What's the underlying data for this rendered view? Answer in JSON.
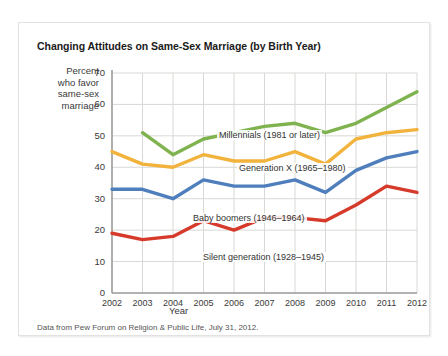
{
  "chart_data": {
    "type": "line",
    "title": "Changing Attitudes on Same-Sex Marriage (by Birth Year)",
    "xlabel": "Year",
    "ylabel": "Percent who favor same-sex marriage",
    "ylabel_lines": [
      "Percent",
      "who favor",
      "same-sex",
      "marriage"
    ],
    "source": "Data from Pew Forum on Religion & Public Life, July 31, 2012.",
    "x": [
      2002,
      2003,
      2004,
      2005,
      2006,
      2007,
      2008,
      2009,
      2010,
      2011,
      2012
    ],
    "xtick_labels": [
      "2002",
      "2003",
      "2004",
      "2005",
      "2006",
      "2007",
      "2008",
      "2009",
      "2010",
      "2011",
      "2012"
    ],
    "ytick_labels": [
      "0",
      "10",
      "20",
      "30",
      "40",
      "50",
      "60",
      "70"
    ],
    "ytick_values": [
      0,
      10,
      20,
      30,
      40,
      50,
      60,
      70
    ],
    "ylim": [
      0,
      70
    ],
    "xlim": [
      2002,
      2012
    ],
    "grid": true,
    "legend_position": "inline-annotations",
    "series": [
      {
        "name": "Millennials (1981 or later)",
        "label": "Millennials (1981 or later)",
        "color": "#7FB350",
        "x": [
          2003,
          2004,
          2005,
          2006,
          2007,
          2008,
          2009,
          2010,
          2011,
          2012
        ],
        "values": [
          51,
          44,
          49,
          51,
          53,
          54,
          51,
          54,
          59,
          64
        ],
        "label_x": 198,
        "label_y": 107
      },
      {
        "name": "Generation X (1965-1980)",
        "label": "Generation X (1965–1980)",
        "color": "#F2B33D",
        "x": [
          2002,
          2003,
          2004,
          2005,
          2006,
          2007,
          2008,
          2009,
          2010,
          2011,
          2012
        ],
        "values": [
          45,
          41,
          40,
          44,
          42,
          42,
          45,
          41,
          49,
          51,
          52
        ],
        "label_x": 218,
        "label_y": 140
      },
      {
        "name": "Baby boomers (1946-1964)",
        "label": "Baby boomers (1946–1964)",
        "color": "#4E7EBB",
        "x": [
          2002,
          2003,
          2004,
          2005,
          2006,
          2007,
          2008,
          2009,
          2010,
          2011,
          2012
        ],
        "values": [
          33,
          33,
          30,
          36,
          34,
          34,
          36,
          32,
          39,
          43,
          45
        ],
        "label_x": 172,
        "label_y": 190
      },
      {
        "name": "Silent generation (1928-1945)",
        "label": "Silent generation (1928–1945)",
        "color": "#D63A2A",
        "x": [
          2002,
          2003,
          2004,
          2005,
          2006,
          2007,
          2008,
          2009,
          2010,
          2011,
          2012
        ],
        "values": [
          19,
          17,
          18,
          23,
          20,
          24,
          24,
          23,
          28,
          34,
          32
        ],
        "label_x": 182,
        "label_y": 229
      }
    ]
  }
}
